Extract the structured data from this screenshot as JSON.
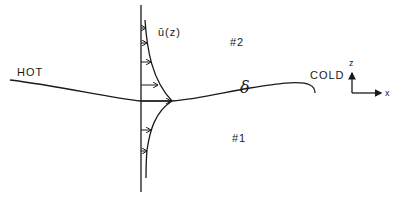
{
  "labels": {
    "hot": "HOT",
    "cold": "COLD",
    "velocity_profile": "ū(z)",
    "region_upper": "#2",
    "region_lower": "#1",
    "interface_symbol": "δ",
    "axis_z": "z",
    "axis_x": "x"
  },
  "colors": {
    "ink": "#1a1a1a",
    "background": "#ffffff"
  }
}
